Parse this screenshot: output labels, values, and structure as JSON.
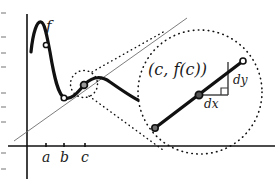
{
  "figure": {
    "kind": "calculus-differential-diagram",
    "background_color": "#ffffff",
    "ink_color": "#111111",
    "thin_line_color": "#6e6e6e",
    "labels": {
      "function": "f",
      "tick_a": "a",
      "tick_b": "b",
      "tick_c": "c",
      "point_c": "(c, f(c))",
      "differential_x": "dx",
      "differential_y": "dy"
    },
    "axes": {
      "x_axis_y": 146,
      "y_axis_x": 27,
      "x_axis_start": 8,
      "x_axis_end": 275,
      "y_axis_top": 14,
      "y_axis_bottom": 179,
      "ticks": [
        {
          "label": "a",
          "x": 46
        },
        {
          "label": "b",
          "x": 64
        },
        {
          "label": "c",
          "x": 85
        }
      ]
    },
    "curve": {
      "stroke_width": 3.2,
      "path": "M 31,52 C 33,32 37,21 41,22 C 45,23 47,37 50,52 C 54,76 58,96 65,98 C 72,100 78,92 85,84 C 93,76 102,76 110,82 C 120,89 130,96 138,100"
    },
    "straight_line": {
      "description": "thin line through the curve near b and c",
      "x1": 14,
      "y1": 141,
      "x2": 187,
      "y2": 18,
      "stroke_width": 0.9
    },
    "marked_points": [
      {
        "name": "point-at-a",
        "x": 46,
        "y": 45,
        "r": 2.6
      },
      {
        "name": "point-at-b",
        "x": 64,
        "y": 98,
        "r": 2.8
      },
      {
        "name": "point-at-c",
        "x": 84,
        "y": 85,
        "r": 3.4
      }
    ],
    "small_circle": {
      "cx": 84,
      "cy": 84,
      "r": 13.5
    },
    "large_circle": {
      "cx": 200,
      "cy": 92,
      "r": 62
    },
    "magnifier_cone": [
      {
        "x1": 92,
        "y1": 72,
        "x2": 165,
        "y2": 31
      },
      {
        "x1": 89,
        "y1": 96,
        "x2": 163,
        "y2": 150
      }
    ],
    "inset": {
      "tangent_segment": {
        "x1": 155,
        "y1": 128,
        "x2": 243,
        "y2": 61,
        "stroke_width": 3.2
      },
      "tangent_endpoints": [
        {
          "name": "tangent-lower-endpoint",
          "x": 155,
          "y": 128,
          "r": 3.2
        },
        {
          "name": "tangent-upper-endpoint",
          "x": 243,
          "y": 61,
          "r": 3.0
        }
      ],
      "center_point": {
        "name": "point-c-magnified",
        "x": 199,
        "y": 95,
        "r": 3.6
      },
      "dx_leg": {
        "x1": 199,
        "y1": 95,
        "x2": 228,
        "y2": 95
      },
      "dy_leg": {
        "x1": 228,
        "y1": 95,
        "x2": 228,
        "y2": 62
      },
      "right_angle_marker": {
        "x": 221,
        "y": 88,
        "size": 7
      }
    },
    "scan_artifacts_left_edge": [
      12,
      36,
      52,
      66,
      92,
      106,
      121,
      152,
      168
    ]
  }
}
